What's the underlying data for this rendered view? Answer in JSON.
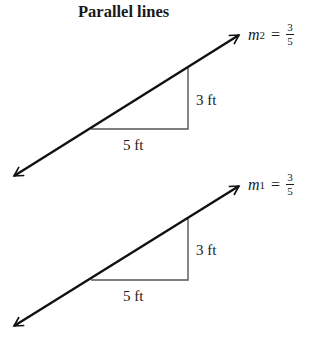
{
  "title": "Parallel lines",
  "lines": [
    {
      "name": "line-2",
      "slope_label": {
        "var": "m",
        "sub": "2",
        "eq": "=",
        "num": "3",
        "den": "5"
      },
      "rise_label": "3 ft",
      "run_label": "5 ft"
    },
    {
      "name": "line-1",
      "slope_label": {
        "var": "m",
        "sub": "1",
        "eq": "=",
        "num": "3",
        "den": "5"
      },
      "rise_label": "3 ft",
      "run_label": "5 ft"
    }
  ],
  "colors": {
    "line": "#111111",
    "triangle": "#555555",
    "text": "#1a1a1a"
  }
}
